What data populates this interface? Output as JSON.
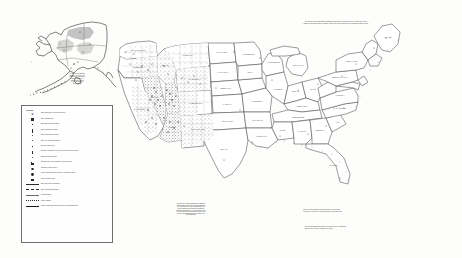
{
  "document": {
    "type": "printed-map-scan",
    "subject": "United States map with Alaska inset, legend panel and annotation notes",
    "background_color": "#fdfdfc",
    "ink_color": "#2b2b2b"
  },
  "alaska_inset": {
    "name": "Alaska",
    "note_lines": [
      "ALASKA STATE OFFICE",
      "222 W. 7th Avenue #13",
      "Anchorage, Alaska 99513",
      "Alaska is shown at a",
      "reduced scale relative",
      "to the conterminous",
      "United States"
    ]
  },
  "legend": {
    "title": "LEGEND",
    "entries": [
      {
        "symbol": "star",
        "label": "BLM State Office (with\nState Director)"
      },
      {
        "symbol": "square",
        "label": "BLM Headquarters"
      },
      {
        "symbol": "square-sm",
        "label": "BLM District Office Location"
      },
      {
        "symbol": "bar",
        "label": "BLM Field Office Location"
      },
      {
        "symbol": "dot",
        "label": "BLM Field Station Location"
      },
      {
        "symbol": "dot-sm",
        "label": "BLM Fire and Training Center"
      },
      {
        "symbol": "dot-xs",
        "label": "BLM Site and Center"
      },
      {
        "symbol": "bar-tall",
        "label": "National Interagency Fire\nCenter and Interagency\nCenter"
      },
      {
        "symbol": "dot-sm2",
        "label": "National Training\nCenter"
      },
      {
        "symbol": "flag",
        "label": "National Wild Horse and\nBurro Adoption Center"
      },
      {
        "symbol": "circle-open",
        "label": "National Heritage Center"
      },
      {
        "symbol": "circle-fill",
        "label": "Public Lands Information\nCenter / Interagency Office"
      },
      {
        "symbol": "sym-sq-open",
        "label": "Other Federal Facility"
      },
      {
        "symbol": "line-solid",
        "label": "BLM State Office Jurisdiction"
      },
      {
        "symbol": "line-dash",
        "label": "BLM Field Office Boundary"
      },
      {
        "symbol": "line-thin",
        "label": "State Boundary"
      },
      {
        "symbol": "line-dot",
        "label": "Major Highway"
      },
      {
        "symbol": "line-heavy",
        "label": "Lands Administered by the\nBureau of Land Management"
      }
    ]
  },
  "notes": {
    "top_right": [
      "The Bureau of Land Management administers approximately 245 million acres of public land, located",
      "primarily in 12 Western States, including Alaska, as well as 700 million acres of subsurface mineral estate."
    ],
    "bottom_center": [
      "The Bureau of Land Management administers",
      "public lands and resources in partnership with",
      "the American people. The National System of",
      "Public Lands includes National Monuments,",
      "National Conservation Areas, Wilderness Areas,",
      "Wild and Scenic Rivers, National Historic and",
      "Scenic Trails and Conservation Lands of the",
      "California Desert."
    ],
    "florida": [
      "Today, the BLM administers 245 million surface acres, most",
      "of which are located in the 12 Western States, including Alaska."
    ],
    "right_lower": [
      "The agency manages an additional 700 million acres of subsurface",
      "mineral estate located throughout the country."
    ]
  },
  "map": {
    "title": "United States",
    "regions": {
      "west_dense_states": [
        "Washington",
        "Oregon",
        "California",
        "Nevada",
        "Idaho",
        "Montana",
        "Wyoming",
        "Utah",
        "Colorado",
        "Arizona",
        "New Mexico"
      ],
      "east_sparse": true
    },
    "state_labels": [
      "WASHINGTON",
      "OREGON",
      "CALIFORNIA",
      "NEVADA",
      "IDAHO",
      "MONTANA",
      "WYOMING",
      "UTAH",
      "COLORADO",
      "ARIZONA",
      "NEW MEXICO",
      "NORTH DAKOTA",
      "SOUTH DAKOTA",
      "NEBRASKA",
      "KANSAS",
      "OKLAHOMA",
      "TEXAS",
      "MINNESOTA",
      "IOWA",
      "MISSOURI",
      "ARKANSAS",
      "LOUISIANA",
      "WISCONSIN",
      "ILLINOIS",
      "MICHIGAN",
      "INDIANA",
      "OHIO",
      "KENTUCKY",
      "TENNESSEE",
      "MISSISSIPPI",
      "ALABAMA",
      "GEORGIA",
      "FLORIDA",
      "SOUTH CAROLINA",
      "NORTH CAROLINA",
      "VIRGINIA",
      "WEST VIRGINIA",
      "PENNSYLVANIA",
      "NEW YORK",
      "MAINE",
      "VERMONT",
      "NEW HAMPSHIRE",
      "MASSACHUSETTS",
      "CONNECTICUT",
      "NEW JERSEY",
      "MARYLAND",
      "DELAWARE",
      "RHODE ISLAND"
    ]
  }
}
